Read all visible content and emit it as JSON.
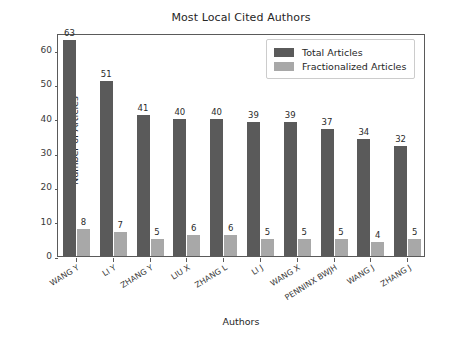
{
  "chart_data": {
    "type": "bar",
    "title": "Most Local Cited Authors",
    "xlabel": "Authors",
    "ylabel": "Number of Articles",
    "categories": [
      "WANG Y",
      "LI Y",
      "ZHANG Y",
      "LIU X",
      "ZHANG L",
      "LI J",
      "WANG X",
      "PENNINX BWJH",
      "WANG J",
      "ZHANG J"
    ],
    "series": [
      {
        "name": "Total Articles",
        "color": "#5a5a5a",
        "values": [
          63,
          51,
          41,
          40,
          40,
          39,
          39,
          37,
          34,
          32
        ]
      },
      {
        "name": "Fractionalized Articles",
        "color": "#a8a8a8",
        "values": [
          8,
          7,
          5,
          6,
          6,
          5,
          5,
          5,
          4,
          5
        ]
      }
    ],
    "ylim": [
      0,
      65
    ],
    "yticks": [
      0,
      10,
      20,
      30,
      40,
      50,
      60
    ],
    "grid": false,
    "legend_position": "upper right",
    "show_value_labels": true
  },
  "legend": {
    "entries": [
      {
        "label": "Total Articles"
      },
      {
        "label": "Fractionalized Articles"
      }
    ]
  }
}
